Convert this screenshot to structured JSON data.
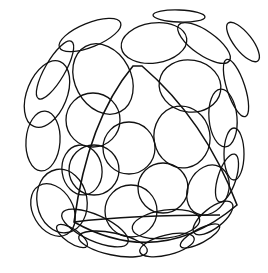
{
  "figure": {
    "title": "",
    "stroke_color": "#111111",
    "background": "#ffffff"
  },
  "sphere": {
    "cx": 134,
    "cy": 134,
    "r": 118
  },
  "cells": [
    {
      "cx": 179,
      "cy": 16,
      "rx": 26,
      "ry": 6,
      "rot": 2
    },
    {
      "cx": 90,
      "cy": 35,
      "rx": 33,
      "ry": 12,
      "rot": -22
    },
    {
      "cx": 243,
      "cy": 42,
      "rx": 9,
      "ry": 24,
      "rot": -38
    },
    {
      "cx": 204,
      "cy": 43,
      "rx": 12,
      "ry": 31,
      "rot": -55
    },
    {
      "cx": 154,
      "cy": 43,
      "rx": 33,
      "ry": 20,
      "rot": -8
    },
    {
      "cx": 55,
      "cy": 70,
      "rx": 10,
      "ry": 33,
      "rot": 30
    },
    {
      "cx": 103,
      "cy": 79,
      "rx": 28,
      "ry": 37,
      "rot": -28
    },
    {
      "cx": 190,
      "cy": 86,
      "rx": 31,
      "ry": 26,
      "rot": 10
    },
    {
      "cx": 47,
      "cy": 94,
      "rx": 20,
      "ry": 35,
      "rot": 22
    },
    {
      "cx": 236,
      "cy": 88,
      "rx": 9,
      "ry": 30,
      "rot": -18
    },
    {
      "cx": 223,
      "cy": 118,
      "rx": 14,
      "ry": 29,
      "rot": -5
    },
    {
      "cx": 93,
      "cy": 120,
      "rx": 27,
      "ry": 27,
      "rot": 0
    },
    {
      "cx": 182,
      "cy": 137,
      "rx": 28,
      "ry": 31,
      "rot": -10
    },
    {
      "cx": 43,
      "cy": 141,
      "rx": 17,
      "ry": 30,
      "rot": 4
    },
    {
      "cx": 234,
      "cy": 154,
      "rx": 10,
      "ry": 26,
      "rot": 0
    },
    {
      "cx": 62,
      "cy": 201,
      "rx": 25,
      "ry": 32,
      "rot": -10
    },
    {
      "cx": 129,
      "cy": 148,
      "rx": 26,
      "ry": 26,
      "rot": 0
    },
    {
      "cx": 82,
      "cy": 170,
      "rx": 20,
      "ry": 25,
      "rot": -8
    },
    {
      "cx": 94,
      "cy": 170,
      "rx": 25,
      "ry": 25,
      "rot": 0
    },
    {
      "cx": 163,
      "cy": 188,
      "rx": 25,
      "ry": 25,
      "rot": 0
    },
    {
      "cx": 208,
      "cy": 190,
      "rx": 20,
      "ry": 26,
      "rot": 26
    },
    {
      "cx": 53,
      "cy": 210,
      "rx": 20,
      "ry": 28,
      "rot": -30
    },
    {
      "cx": 131,
      "cy": 211,
      "rx": 26,
      "ry": 26,
      "rot": 0
    },
    {
      "cx": 227,
      "cy": 178,
      "rx": 9,
      "ry": 25,
      "rot": 18
    },
    {
      "cx": 95,
      "cy": 228,
      "rx": 36,
      "ry": 13,
      "rot": 24
    },
    {
      "cx": 166,
      "cy": 224,
      "rx": 34,
      "ry": 14,
      "rot": -8
    },
    {
      "cx": 213,
      "cy": 218,
      "rx": 24,
      "ry": 10,
      "rot": -38
    },
    {
      "cx": 113,
      "cy": 244,
      "rx": 35,
      "ry": 11,
      "rot": 12
    },
    {
      "cx": 167,
      "cy": 245,
      "rx": 28,
      "ry": 10,
      "rot": -14
    },
    {
      "cx": 72,
      "cy": 236,
      "rx": 18,
      "ry": 7,
      "rot": 34
    },
    {
      "cx": 200,
      "cy": 236,
      "rx": 22,
      "ry": 7,
      "rot": -28
    }
  ],
  "wedge": {
    "path": "M 74 222 Q 88 120 133 66 L 142 66 Q 205 120 237 205 Q 160 270 74 222 Z",
    "inner_path": "M 74 222 Q 130 215 220 215"
  }
}
